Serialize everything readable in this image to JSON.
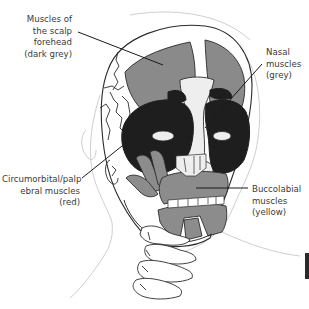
{
  "diagram": {
    "colors": {
      "background": "#ffffff",
      "outline": "#2b2b2b",
      "skin_outline": "#c8c8c8",
      "scalp_forehead_muscle": "#8a8a8a",
      "nasal_muscle": "#1e1e1e",
      "circumorbital_muscle": "#1e1e1e",
      "buccolabial_muscle": "#8c8c8c",
      "bone": "#eeeeee",
      "label_text": "#3a3a3a",
      "leader_line": "#1a1a1a"
    },
    "labels": [
      {
        "id": "scalp",
        "lines": [
          "Muscles of",
          "the scalp",
          "forehead",
          "(dark grey)"
        ]
      },
      {
        "id": "nasal",
        "lines": [
          "Nasal",
          "muscles",
          "(grey)"
        ]
      },
      {
        "id": "circumorbital",
        "lines": [
          "Circumorbital/palp",
          "ebral muscles",
          "(red)"
        ]
      },
      {
        "id": "buccolabial",
        "lines": [
          "Buccolabial",
          "muscles",
          "(yellow)"
        ]
      }
    ]
  }
}
